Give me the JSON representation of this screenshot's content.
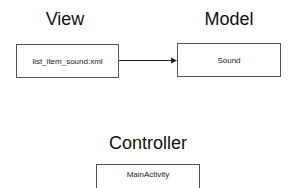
{
  "diagram": {
    "sections": {
      "view": {
        "heading": "View",
        "component": "list_item_sound.xml"
      },
      "model": {
        "heading": "Model",
        "component": "Sound"
      },
      "controller": {
        "heading": "Controller",
        "component": "MainActivity"
      }
    },
    "edges": [
      {
        "from": "list_item_sound.xml",
        "to": "Sound",
        "type": "arrow"
      }
    ],
    "colors": {
      "background": "#ffffff",
      "border": "#555555",
      "text": "#111111"
    }
  }
}
